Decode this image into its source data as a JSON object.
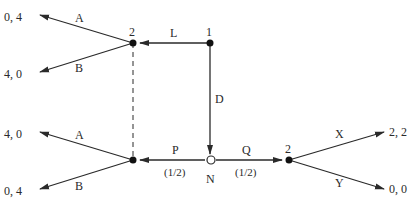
{
  "diagram": {
    "type": "extensive-form game tree",
    "nodes": {
      "player1": {
        "label": "1"
      },
      "player2_top": {
        "label": "2"
      },
      "player2_bottom_left": {
        "label": ""
      },
      "nature": {
        "label": "N"
      },
      "player2_right": {
        "label": "2"
      }
    },
    "edges": {
      "L": {
        "label": "L"
      },
      "D": {
        "label": "D"
      },
      "P": {
        "label": "P",
        "prob": "(1/2)"
      },
      "Q": {
        "label": "Q",
        "prob": "(1/2)"
      },
      "A_top": {
        "label": "A"
      },
      "B_top": {
        "label": "B"
      },
      "A_bottom": {
        "label": "A"
      },
      "B_bottom": {
        "label": "B"
      },
      "X": {
        "label": "X"
      },
      "Y": {
        "label": "Y"
      }
    },
    "payoffs": {
      "top_A": "0, 4",
      "top_B": "4, 0",
      "bottom_A": "4, 0",
      "bottom_B": "0, 4",
      "right_X": "2, 2",
      "right_Y": "0, 0"
    },
    "colors": {
      "line": "#2a2a2a",
      "node_fill": "#111111",
      "chance_node_fill": "#ffffff"
    }
  }
}
